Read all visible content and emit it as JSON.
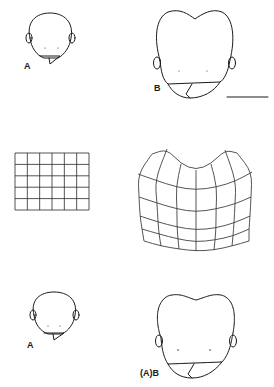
{
  "figure": {
    "background": "#ffffff",
    "line_color": "#1a1a1a",
    "panels": [
      {
        "id": "top-left",
        "label": "A",
        "label_pos": [
          24,
          62
        ]
      },
      {
        "id": "top-right",
        "label": "B",
        "label_pos": [
          154,
          84
        ]
      },
      {
        "id": "middle-left",
        "label": "",
        "description": "undeformed rectangular grid, 6 columns x 5 rows"
      },
      {
        "id": "middle-right",
        "label": "",
        "description": "deformed grid after transformation"
      },
      {
        "id": "bottom-left",
        "label": "A",
        "label_pos": [
          27,
          341
        ]
      },
      {
        "id": "bottom-right",
        "label": "(A)B",
        "label_pos": [
          140,
          369
        ]
      }
    ],
    "scale_bar": {
      "x1": 227,
      "x2": 268,
      "y": 97
    },
    "rect_grid": {
      "x0": 15,
      "y0": 153,
      "x1": 89,
      "y1": 210,
      "cols": 6,
      "rows": 5
    },
    "deformed_grid": {
      "rows": [
        [
          [
            152,
            154
          ],
          [
            167,
            149
          ],
          [
            181,
            164
          ],
          [
            196,
            170
          ],
          [
            211,
            164
          ],
          [
            225,
            150
          ],
          [
            237,
            153
          ]
        ],
        [
          [
            138,
            174
          ],
          [
            155,
            180
          ],
          [
            176,
            187
          ],
          [
            196,
            190
          ],
          [
            217,
            187
          ],
          [
            236,
            181
          ],
          [
            252,
            172
          ]
        ],
        [
          [
            139,
            197
          ],
          [
            157,
            203
          ],
          [
            177,
            209
          ],
          [
            196,
            212
          ],
          [
            216,
            209
          ],
          [
            235,
            204
          ],
          [
            251,
            197
          ]
        ],
        [
          [
            140,
            216
          ],
          [
            158,
            222
          ],
          [
            177,
            227
          ],
          [
            196,
            230
          ],
          [
            216,
            228
          ],
          [
            234,
            223
          ],
          [
            250,
            216
          ]
        ],
        [
          [
            142,
            229
          ],
          [
            159,
            234
          ],
          [
            178,
            239
          ],
          [
            196,
            242
          ],
          [
            215,
            240
          ],
          [
            233,
            236
          ],
          [
            249,
            229
          ]
        ],
        [
          [
            144,
            241
          ],
          [
            161,
            246
          ],
          [
            179,
            249
          ],
          [
            196,
            251
          ],
          [
            214,
            250
          ],
          [
            232,
            246
          ],
          [
            249,
            241
          ]
        ]
      ]
    }
  }
}
